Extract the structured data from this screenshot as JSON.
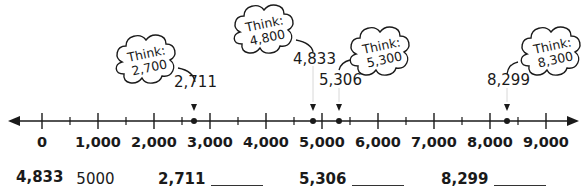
{
  "number_line": {
    "min": 0,
    "max": 9000,
    "major_step": 1000,
    "minor_step": 500,
    "tick_labels": [
      "0",
      "1,000",
      "2,000",
      "3,000",
      "4,000",
      "5,000",
      "6,000",
      "7,000",
      "8,000",
      "9,000"
    ],
    "points": [
      {
        "value": 2711,
        "label": "2,711",
        "think_title": "Think:",
        "think_value": "2,700"
      },
      {
        "value": 4833,
        "label": "4,833",
        "think_title": "Think:",
        "think_value": "4,800"
      },
      {
        "value": 5306,
        "label": "5,306",
        "think_title": "Think:",
        "think_value": "5,300"
      },
      {
        "value": 8299,
        "label": "8,299",
        "think_title": "Think:",
        "think_value": "8,300"
      }
    ]
  },
  "answers": [
    {
      "number": "4,833",
      "answer": "5000"
    },
    {
      "number": "2,711",
      "answer": ""
    },
    {
      "number": "5,306",
      "answer": ""
    },
    {
      "number": "8,299",
      "answer": ""
    }
  ],
  "colors": {
    "ink": "#1a1a1a",
    "background": "#ffffff"
  }
}
